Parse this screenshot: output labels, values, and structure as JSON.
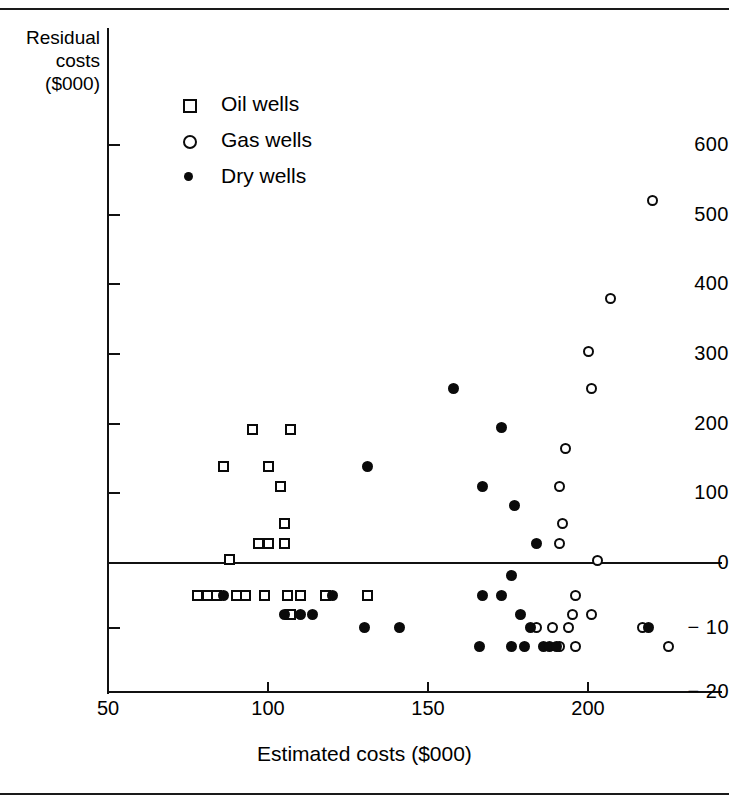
{
  "chart_data": {
    "type": "scatter",
    "title": "",
    "xlabel": "Estimated costs ($000)",
    "ylabel_lines": [
      "Residual",
      "costs",
      "($000)"
    ],
    "ylabel": "Residual costs ($000)",
    "grid": false,
    "legend_position": "upper-left-inside",
    "xlim": [
      50,
      228
    ],
    "xticks": [
      50,
      100,
      150,
      200
    ],
    "xticklabels": [
      "50",
      "100",
      "150",
      "200"
    ],
    "yticks": [
      600,
      500,
      400,
      300,
      200,
      100,
      0,
      -10,
      -20
    ],
    "yticklabels": [
      "600",
      "500",
      "400",
      "300",
      "200",
      "100",
      "0",
      "− 10",
      "− 20"
    ],
    "y_axis_note": "Broken scale: above 0 the axis is in steps of 100; below 0 it is in steps of 10",
    "zero_reference_line": 0,
    "series": [
      {
        "name": "Oil wells",
        "marker": "open-square",
        "color": "#0a0a0a",
        "points": [
          [
            88,
            5
          ],
          [
            86,
            138
          ],
          [
            95,
            192
          ],
          [
            100,
            138
          ],
          [
            107,
            192
          ],
          [
            104,
            110
          ],
          [
            105,
            57
          ],
          [
            97,
            28
          ],
          [
            100,
            28
          ],
          [
            105,
            28
          ],
          [
            78,
            -5
          ],
          [
            81,
            -5
          ],
          [
            84,
            -5
          ],
          [
            90,
            -5
          ],
          [
            93,
            -5
          ],
          [
            99,
            -5
          ],
          [
            106,
            -5
          ],
          [
            110,
            -5
          ],
          [
            118,
            -5
          ],
          [
            131,
            -5
          ],
          [
            107,
            -8
          ]
        ]
      },
      {
        "name": "Gas wells",
        "marker": "open-circle",
        "color": "#0a0a0a",
        "points": [
          [
            220,
            520
          ],
          [
            207,
            380
          ],
          [
            200,
            303
          ],
          [
            201,
            250
          ],
          [
            193,
            165
          ],
          [
            191,
            110
          ],
          [
            192,
            57
          ],
          [
            191,
            28
          ],
          [
            203,
            4
          ],
          [
            196,
            -5
          ],
          [
            195,
            -8
          ],
          [
            201,
            -8
          ],
          [
            184,
            -10
          ],
          [
            189,
            -10
          ],
          [
            194,
            -10
          ],
          [
            217,
            -10
          ],
          [
            191,
            -13
          ],
          [
            196,
            -13
          ],
          [
            225,
            -13
          ]
        ]
      },
      {
        "name": "Dry wells",
        "marker": "filled-circle",
        "color": "#0a0a0a",
        "points": [
          [
            158,
            250
          ],
          [
            173,
            195
          ],
          [
            131,
            138
          ],
          [
            167,
            110
          ],
          [
            177,
            83
          ],
          [
            184,
            28
          ],
          [
            176,
            -2
          ],
          [
            86,
            -5
          ],
          [
            120,
            -5
          ],
          [
            167,
            -5
          ],
          [
            173,
            -5
          ],
          [
            105,
            -8
          ],
          [
            110,
            -8
          ],
          [
            114,
            -8
          ],
          [
            179,
            -8
          ],
          [
            130,
            -10
          ],
          [
            141,
            -10
          ],
          [
            182,
            -10
          ],
          [
            219,
            -10
          ],
          [
            166,
            -13
          ],
          [
            176,
            -13
          ],
          [
            180,
            -13
          ],
          [
            186,
            -13
          ],
          [
            188,
            -13
          ],
          [
            190,
            -13
          ]
        ]
      }
    ]
  },
  "legend": {
    "items": [
      {
        "label": "Oil wells",
        "marker": "open-square"
      },
      {
        "label": "Gas wells",
        "marker": "open-circle"
      },
      {
        "label": "Dry wells",
        "marker": "filled-circle"
      }
    ]
  }
}
